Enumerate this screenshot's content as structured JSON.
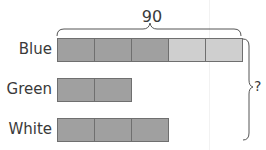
{
  "diagram": {
    "top_total": "90",
    "right_total": "?",
    "rows": [
      {
        "label": "Blue",
        "boxes": [
          {
            "shade": "dark",
            "color": "#a0a0a0"
          },
          {
            "shade": "dark",
            "color": "#a0a0a0"
          },
          {
            "shade": "dark",
            "color": "#a0a0a0"
          },
          {
            "shade": "light",
            "color": "#cfcfcf"
          },
          {
            "shade": "light",
            "color": "#cfcfcf"
          }
        ]
      },
      {
        "label": "Green",
        "boxes": [
          {
            "shade": "dark",
            "color": "#a0a0a0"
          },
          {
            "shade": "dark",
            "color": "#a0a0a0"
          }
        ]
      },
      {
        "label": "White",
        "boxes": [
          {
            "shade": "dark",
            "color": "#a0a0a0"
          },
          {
            "shade": "dark",
            "color": "#a0a0a0"
          },
          {
            "shade": "dark",
            "color": "#a0a0a0"
          }
        ]
      }
    ],
    "colors": {
      "dark_box": "#a0a0a0",
      "light_box": "#cfcfcf",
      "border": "#6f6f6f",
      "text": "#3a3a3a"
    }
  }
}
